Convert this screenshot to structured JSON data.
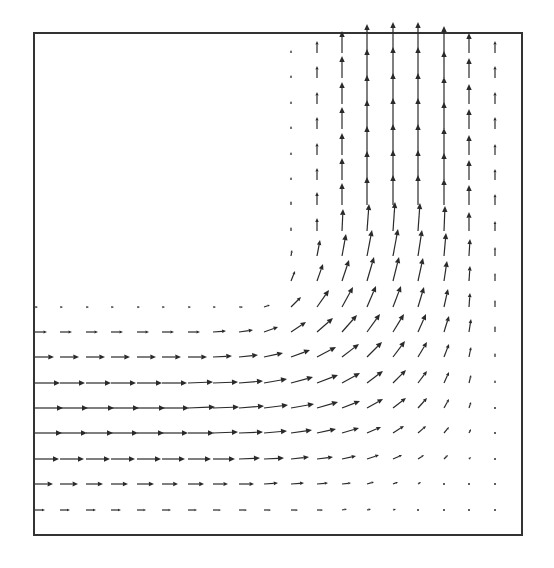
{
  "chart_data": {
    "type": "quiver",
    "title": "",
    "xlabel": "",
    "ylabel": "",
    "grid": false,
    "legend": null,
    "frame": {
      "left": 34,
      "top": 33,
      "right": 522,
      "bottom": 535,
      "color": "#333333"
    },
    "arrow_color": "#2a2a2a",
    "grid_columns_x": [
      35,
      60,
      86,
      111,
      137,
      162,
      188,
      213,
      239,
      264,
      291,
      317,
      342,
      367,
      393,
      418,
      444,
      469,
      495
    ],
    "grid_rows_y": [
      53,
      78,
      104,
      129,
      155,
      180,
      205,
      231,
      256,
      281,
      307,
      332,
      357,
      383,
      408,
      433,
      459,
      484,
      510
    ],
    "horizontal_leg": {
      "rows_y": [
        307,
        332,
        357,
        383,
        408,
        433,
        459,
        484,
        510
      ],
      "speed_profile_px": [
        4,
        14,
        20,
        26,
        28,
        27,
        24,
        18,
        10
      ]
    },
    "vertical_leg": {
      "columns_x": [
        291,
        317,
        342,
        367,
        393,
        418,
        444,
        469,
        495
      ],
      "speed_profile_px": [
        4,
        14,
        22,
        28,
        30,
        30,
        26,
        20,
        12
      ]
    },
    "vectors": [
      [
        291,
        53,
        0,
        -3
      ],
      [
        317,
        53,
        0,
        -12
      ],
      [
        342,
        53,
        0,
        -22
      ],
      [
        367,
        53,
        0,
        -29
      ],
      [
        393,
        53,
        0,
        -31
      ],
      [
        418,
        53,
        0,
        -31
      ],
      [
        444,
        53,
        0,
        -27
      ],
      [
        469,
        53,
        0,
        -20
      ],
      [
        495,
        53,
        0,
        -12
      ],
      [
        291,
        78,
        0,
        -3
      ],
      [
        317,
        78,
        0,
        -12
      ],
      [
        342,
        78,
        0,
        -22
      ],
      [
        367,
        78,
        0,
        -29
      ],
      [
        393,
        78,
        0,
        -31
      ],
      [
        418,
        78,
        0,
        -31
      ],
      [
        444,
        78,
        0,
        -27
      ],
      [
        469,
        78,
        0,
        -20
      ],
      [
        495,
        78,
        0,
        -12
      ],
      [
        291,
        104,
        0,
        -3
      ],
      [
        317,
        104,
        0,
        -12
      ],
      [
        342,
        104,
        0,
        -22
      ],
      [
        367,
        104,
        0,
        -29
      ],
      [
        393,
        104,
        0,
        -31
      ],
      [
        418,
        104,
        0,
        -31
      ],
      [
        444,
        104,
        0,
        -27
      ],
      [
        469,
        104,
        0,
        -20
      ],
      [
        495,
        104,
        0,
        -12
      ],
      [
        291,
        129,
        0,
        -3
      ],
      [
        317,
        129,
        0,
        -12
      ],
      [
        342,
        129,
        0,
        -22
      ],
      [
        367,
        129,
        0,
        -29
      ],
      [
        393,
        129,
        0,
        -31
      ],
      [
        418,
        129,
        0,
        -31
      ],
      [
        444,
        129,
        0,
        -27
      ],
      [
        469,
        129,
        0,
        -20
      ],
      [
        495,
        129,
        0,
        -12
      ],
      [
        291,
        155,
        0,
        -3
      ],
      [
        317,
        155,
        0,
        -12
      ],
      [
        342,
        155,
        0,
        -22
      ],
      [
        367,
        155,
        0,
        -29
      ],
      [
        393,
        155,
        0,
        -31
      ],
      [
        418,
        155,
        0,
        -31
      ],
      [
        444,
        155,
        0,
        -27
      ],
      [
        469,
        155,
        0,
        -20
      ],
      [
        495,
        155,
        0,
        -11
      ],
      [
        291,
        180,
        0,
        -3
      ],
      [
        317,
        180,
        0,
        -12
      ],
      [
        342,
        180,
        0,
        -22
      ],
      [
        367,
        180,
        0,
        -29
      ],
      [
        393,
        180,
        0,
        -30
      ],
      [
        418,
        180,
        0,
        -30
      ],
      [
        444,
        180,
        0,
        -27
      ],
      [
        469,
        180,
        0,
        -20
      ],
      [
        495,
        180,
        0,
        -11
      ],
      [
        291,
        205,
        0,
        -4
      ],
      [
        317,
        205,
        0,
        -13
      ],
      [
        342,
        205,
        0,
        -22
      ],
      [
        367,
        205,
        0,
        -28
      ],
      [
        393,
        205,
        0,
        -30
      ],
      [
        418,
        205,
        0,
        -30
      ],
      [
        444,
        205,
        0,
        -26
      ],
      [
        469,
        205,
        0,
        -20
      ],
      [
        495,
        205,
        0,
        -11
      ],
      [
        291,
        231,
        0,
        -4
      ],
      [
        317,
        231,
        0,
        -13
      ],
      [
        342,
        231,
        1,
        -22
      ],
      [
        367,
        231,
        2,
        -27
      ],
      [
        393,
        231,
        2,
        -29
      ],
      [
        418,
        231,
        2,
        -28
      ],
      [
        444,
        231,
        1,
        -25
      ],
      [
        469,
        231,
        0,
        -19
      ],
      [
        495,
        231,
        0,
        -10
      ],
      [
        291,
        256,
        1,
        -6
      ],
      [
        317,
        256,
        3,
        -16
      ],
      [
        342,
        256,
        4,
        -22
      ],
      [
        367,
        256,
        5,
        -26
      ],
      [
        393,
        256,
        5,
        -27
      ],
      [
        418,
        256,
        4,
        -26
      ],
      [
        444,
        256,
        2,
        -23
      ],
      [
        469,
        256,
        1,
        -17
      ],
      [
        495,
        256,
        0,
        -9
      ],
      [
        291,
        281,
        4,
        -10
      ],
      [
        317,
        281,
        6,
        -17
      ],
      [
        342,
        281,
        7,
        -21
      ],
      [
        367,
        281,
        7,
        -24
      ],
      [
        393,
        281,
        6,
        -24
      ],
      [
        418,
        281,
        5,
        -23
      ],
      [
        444,
        281,
        3,
        -20
      ],
      [
        469,
        281,
        1,
        -15
      ],
      [
        495,
        281,
        0,
        -8
      ],
      [
        35,
        307,
        3,
        0
      ],
      [
        60,
        307,
        3,
        0
      ],
      [
        86,
        307,
        3,
        0
      ],
      [
        111,
        307,
        3,
        0
      ],
      [
        137,
        307,
        3,
        0
      ],
      [
        162,
        307,
        3,
        0
      ],
      [
        188,
        307,
        3,
        0
      ],
      [
        213,
        307,
        3,
        0
      ],
      [
        239,
        307,
        4,
        0
      ],
      [
        264,
        307,
        6,
        -2
      ],
      [
        291,
        307,
        10,
        -10
      ],
      [
        317,
        307,
        12,
        -17
      ],
      [
        342,
        307,
        11,
        -20
      ],
      [
        367,
        307,
        9,
        -21
      ],
      [
        393,
        307,
        8,
        -21
      ],
      [
        418,
        307,
        6,
        -20
      ],
      [
        444,
        307,
        4,
        -18
      ],
      [
        469,
        307,
        1,
        -14
      ],
      [
        495,
        307,
        0,
        -7
      ],
      [
        35,
        332,
        12,
        0
      ],
      [
        60,
        332,
        12,
        0
      ],
      [
        86,
        332,
        12,
        0
      ],
      [
        111,
        332,
        12,
        0
      ],
      [
        137,
        332,
        12,
        0
      ],
      [
        162,
        332,
        12,
        0
      ],
      [
        188,
        332,
        12,
        0
      ],
      [
        213,
        332,
        13,
        -1
      ],
      [
        239,
        332,
        14,
        -2
      ],
      [
        264,
        332,
        14,
        -5
      ],
      [
        291,
        332,
        15,
        -10
      ],
      [
        317,
        332,
        16,
        -14
      ],
      [
        342,
        332,
        15,
        -17
      ],
      [
        367,
        332,
        13,
        -18
      ],
      [
        393,
        332,
        11,
        -18
      ],
      [
        418,
        332,
        8,
        -18
      ],
      [
        444,
        332,
        5,
        -16
      ],
      [
        469,
        332,
        2,
        -13
      ],
      [
        495,
        332,
        0,
        -6
      ],
      [
        35,
        357,
        19,
        0
      ],
      [
        60,
        357,
        19,
        0
      ],
      [
        86,
        357,
        19,
        0
      ],
      [
        111,
        357,
        19,
        0
      ],
      [
        137,
        357,
        19,
        0
      ],
      [
        162,
        357,
        19,
        0
      ],
      [
        188,
        357,
        19,
        0
      ],
      [
        213,
        357,
        19,
        -1
      ],
      [
        239,
        357,
        19,
        -2
      ],
      [
        264,
        357,
        19,
        -4
      ],
      [
        291,
        357,
        19,
        -7
      ],
      [
        317,
        357,
        19,
        -10
      ],
      [
        342,
        357,
        17,
        -13
      ],
      [
        367,
        357,
        15,
        -15
      ],
      [
        393,
        357,
        12,
        -16
      ],
      [
        418,
        357,
        9,
        -15
      ],
      [
        444,
        357,
        5,
        -13
      ],
      [
        469,
        357,
        2,
        -10
      ],
      [
        495,
        357,
        0,
        -4
      ],
      [
        35,
        383,
        25,
        0
      ],
      [
        60,
        383,
        25,
        0
      ],
      [
        86,
        383,
        25,
        0
      ],
      [
        111,
        383,
        25,
        0
      ],
      [
        137,
        383,
        25,
        0
      ],
      [
        162,
        383,
        25,
        0
      ],
      [
        188,
        383,
        25,
        -1
      ],
      [
        213,
        383,
        25,
        -1
      ],
      [
        239,
        383,
        24,
        -2
      ],
      [
        264,
        383,
        23,
        -4
      ],
      [
        291,
        383,
        22,
        -6
      ],
      [
        317,
        383,
        21,
        -8
      ],
      [
        342,
        383,
        18,
        -10
      ],
      [
        367,
        383,
        16,
        -12
      ],
      [
        393,
        383,
        13,
        -13
      ],
      [
        418,
        383,
        9,
        -12
      ],
      [
        444,
        383,
        5,
        -11
      ],
      [
        469,
        383,
        2,
        -8
      ],
      [
        495,
        383,
        0,
        -3
      ],
      [
        35,
        408,
        28,
        0
      ],
      [
        60,
        408,
        28,
        0
      ],
      [
        86,
        408,
        28,
        0
      ],
      [
        111,
        408,
        28,
        0
      ],
      [
        137,
        408,
        28,
        0
      ],
      [
        162,
        408,
        27,
        0
      ],
      [
        188,
        408,
        27,
        -1
      ],
      [
        213,
        408,
        26,
        -1
      ],
      [
        239,
        408,
        25,
        -2
      ],
      [
        264,
        408,
        24,
        -3
      ],
      [
        291,
        408,
        23,
        -4
      ],
      [
        317,
        408,
        21,
        -6
      ],
      [
        342,
        408,
        18,
        -7
      ],
      [
        367,
        408,
        16,
        -9
      ],
      [
        393,
        408,
        13,
        -10
      ],
      [
        418,
        408,
        9,
        -10
      ],
      [
        444,
        408,
        5,
        -9
      ],
      [
        469,
        408,
        2,
        -6
      ],
      [
        495,
        408,
        0,
        -2
      ],
      [
        35,
        433,
        27,
        0
      ],
      [
        60,
        433,
        27,
        0
      ],
      [
        86,
        433,
        27,
        0
      ],
      [
        111,
        433,
        27,
        0
      ],
      [
        137,
        433,
        27,
        0
      ],
      [
        162,
        433,
        26,
        0
      ],
      [
        188,
        433,
        26,
        0
      ],
      [
        213,
        433,
        25,
        -1
      ],
      [
        239,
        433,
        24,
        -1
      ],
      [
        264,
        433,
        23,
        -2
      ],
      [
        291,
        433,
        21,
        -3
      ],
      [
        317,
        433,
        19,
        -4
      ],
      [
        342,
        433,
        17,
        -5
      ],
      [
        367,
        433,
        14,
        -6
      ],
      [
        393,
        433,
        11,
        -7
      ],
      [
        418,
        433,
        8,
        -7
      ],
      [
        444,
        433,
        5,
        -6
      ],
      [
        469,
        433,
        2,
        -4
      ],
      [
        495,
        433,
        0,
        -2
      ],
      [
        35,
        459,
        24,
        0
      ],
      [
        60,
        459,
        24,
        0
      ],
      [
        86,
        459,
        24,
        0
      ],
      [
        111,
        459,
        24,
        0
      ],
      [
        137,
        459,
        24,
        0
      ],
      [
        162,
        459,
        23,
        0
      ],
      [
        188,
        459,
        23,
        0
      ],
      [
        213,
        459,
        22,
        0
      ],
      [
        239,
        459,
        21,
        -1
      ],
      [
        264,
        459,
        20,
        -1
      ],
      [
        291,
        459,
        18,
        -2
      ],
      [
        317,
        459,
        16,
        -2
      ],
      [
        342,
        459,
        14,
        -3
      ],
      [
        367,
        459,
        12,
        -4
      ],
      [
        393,
        459,
        9,
        -4
      ],
      [
        418,
        459,
        6,
        -4
      ],
      [
        444,
        459,
        4,
        -4
      ],
      [
        469,
        459,
        2,
        -2
      ],
      [
        495,
        459,
        0,
        -1
      ],
      [
        35,
        484,
        18,
        0
      ],
      [
        60,
        484,
        18,
        0
      ],
      [
        86,
        484,
        17,
        0
      ],
      [
        111,
        484,
        17,
        0
      ],
      [
        137,
        484,
        17,
        0
      ],
      [
        162,
        484,
        16,
        0
      ],
      [
        188,
        484,
        16,
        0
      ],
      [
        213,
        484,
        15,
        0
      ],
      [
        239,
        484,
        15,
        0
      ],
      [
        264,
        484,
        14,
        -1
      ],
      [
        291,
        484,
        13,
        -1
      ],
      [
        317,
        484,
        11,
        -1
      ],
      [
        342,
        484,
        9,
        -1
      ],
      [
        367,
        484,
        7,
        -2
      ],
      [
        393,
        484,
        5,
        -2
      ],
      [
        418,
        484,
        3,
        -2
      ],
      [
        444,
        484,
        2,
        -1
      ],
      [
        469,
        484,
        1,
        -1
      ],
      [
        495,
        484,
        0,
        -1
      ],
      [
        35,
        510,
        10,
        0
      ],
      [
        60,
        510,
        10,
        0
      ],
      [
        86,
        510,
        10,
        0
      ],
      [
        111,
        510,
        10,
        0
      ],
      [
        137,
        510,
        9,
        0
      ],
      [
        162,
        510,
        9,
        0
      ],
      [
        188,
        510,
        9,
        0
      ],
      [
        213,
        510,
        8,
        0
      ],
      [
        239,
        510,
        8,
        0
      ],
      [
        264,
        510,
        7,
        0
      ],
      [
        291,
        510,
        7,
        0
      ],
      [
        317,
        510,
        6,
        0
      ],
      [
        342,
        510,
        5,
        -1
      ],
      [
        367,
        510,
        4,
        -1
      ],
      [
        393,
        510,
        3,
        -1
      ],
      [
        418,
        510,
        2,
        -1
      ],
      [
        444,
        510,
        1,
        0
      ],
      [
        469,
        510,
        1,
        0
      ],
      [
        495,
        510,
        0,
        -1
      ]
    ]
  }
}
